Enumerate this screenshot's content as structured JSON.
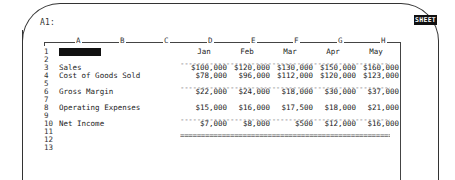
{
  "status": {
    "cell_address": "A1:",
    "mode": "SHEET"
  },
  "columns": [
    {
      "letter": "A",
      "x": 78
    },
    {
      "letter": "B",
      "x": 122
    },
    {
      "letter": "C",
      "x": 166
    },
    {
      "letter": "D",
      "x": 210
    },
    {
      "letter": "E",
      "x": 253
    },
    {
      "letter": "F",
      "x": 296
    },
    {
      "letter": "G",
      "x": 340
    },
    {
      "letter": "H",
      "x": 383
    }
  ],
  "rows": [
    "1",
    "2",
    "3",
    "4",
    "5",
    "6",
    "7",
    "8",
    "9",
    "10",
    "11",
    "12",
    "13"
  ],
  "months": [
    "Jan",
    "Feb",
    "Mar",
    "Apr",
    "May"
  ],
  "line_items": [
    {
      "row": 3,
      "label": "Sales",
      "values": [
        "$100,000",
        "$120,000",
        "$130,000",
        "$150,000",
        "$160,000"
      ]
    },
    {
      "row": 4,
      "label": "Cost of Goods Sold",
      "values": [
        "$78,000",
        "$96,000",
        "$112,000",
        "$120,000",
        "$123,000"
      ]
    },
    {
      "row": 6,
      "label": "Gross Margin",
      "values": [
        "$22,000",
        "$24,000",
        "$18,000",
        "$30,000",
        "$37,000"
      ]
    },
    {
      "row": 8,
      "label": "Operating Expenses",
      "values": [
        "$15,000",
        "$16,000",
        "$17,500",
        "$18,000",
        "$21,000"
      ]
    },
    {
      "row": 10,
      "label": "Net Income",
      "values": [
        "$7,000",
        "$8,000",
        "$500",
        "$12,000",
        "$16,000"
      ]
    }
  ],
  "separators": {
    "single": "------------------------------------------------------------",
    "double": "============================================================"
  }
}
